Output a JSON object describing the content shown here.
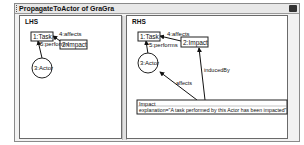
{
  "window": {
    "title": "PropagateToActor of GraGra",
    "icon": "window-menu-icon"
  },
  "lhs": {
    "label": "LHS",
    "nodes": {
      "task": "1:Task",
      "impact": "2:Impact",
      "actor": "3:Actor"
    },
    "edges": {
      "affects": "4:affects",
      "performs": "5:performs"
    }
  },
  "rhs": {
    "label": "RHS",
    "nodes": {
      "task": "1:Task",
      "impact": "2:Impact",
      "actor": "3:Actor",
      "new_impact_title": "Impact",
      "new_impact_attr": "explanation=\"A task performed by this Actor has been impacted\""
    },
    "edges": {
      "affects": "4:affects",
      "performs": "5:performs",
      "new_affects": "affects",
      "induced_by": "inducedBy"
    }
  }
}
